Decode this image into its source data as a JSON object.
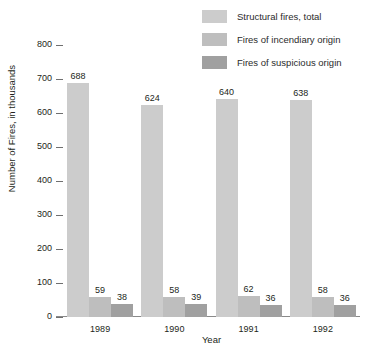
{
  "chart_data": {
    "type": "bar",
    "title": "",
    "xlabel": "Year",
    "ylabel": "Number of Fires, in thousands",
    "categories": [
      "1989",
      "1990",
      "1991",
      "1992"
    ],
    "ylim": [
      0,
      800
    ],
    "yticks": [
      800,
      700,
      600,
      500,
      400,
      300,
      200,
      100,
      0
    ],
    "grid": false,
    "legend_position": "top-right",
    "series": [
      {
        "name": "Structural fires, total",
        "color": "#cccccc",
        "values": [
          688,
          624,
          640,
          638
        ]
      },
      {
        "name": "Fires of incendiary origin",
        "color": "#bebebe",
        "values": [
          59,
          58,
          62,
          58
        ]
      },
      {
        "name": "Fires of suspicious origin",
        "color": "#a0a0a0",
        "values": [
          38,
          39,
          36,
          36
        ]
      }
    ]
  }
}
